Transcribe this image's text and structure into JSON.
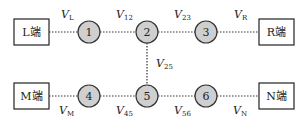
{
  "terminals": [
    {
      "id": "L",
      "label": "L端"
    },
    {
      "id": "R",
      "label": "R端"
    },
    {
      "id": "M",
      "label": "M端"
    },
    {
      "id": "N",
      "label": "N端"
    }
  ],
  "nodes": [
    {
      "id": "1",
      "label": "1"
    },
    {
      "id": "2",
      "label": "2"
    },
    {
      "id": "3",
      "label": "3"
    },
    {
      "id": "4",
      "label": "4"
    },
    {
      "id": "5",
      "label": "5"
    },
    {
      "id": "6",
      "label": "6"
    }
  ],
  "edges": [
    {
      "from": "L",
      "to": "1",
      "var": "V",
      "sub": "L"
    },
    {
      "from": "1",
      "to": "2",
      "var": "V",
      "sub": "12"
    },
    {
      "from": "2",
      "to": "3",
      "var": "V",
      "sub": "23"
    },
    {
      "from": "3",
      "to": "R",
      "var": "V",
      "sub": "R"
    },
    {
      "from": "2",
      "to": "5",
      "var": "V",
      "sub": "25"
    },
    {
      "from": "M",
      "to": "4",
      "var": "V",
      "sub": "M"
    },
    {
      "from": "4",
      "to": "5",
      "var": "V",
      "sub": "45"
    },
    {
      "from": "5",
      "to": "6",
      "var": "V",
      "sub": "56"
    },
    {
      "from": "6",
      "to": "N",
      "var": "V",
      "sub": "N"
    }
  ],
  "colors": {
    "node_fill": "#cfcfcf",
    "stroke": "#333333"
  }
}
